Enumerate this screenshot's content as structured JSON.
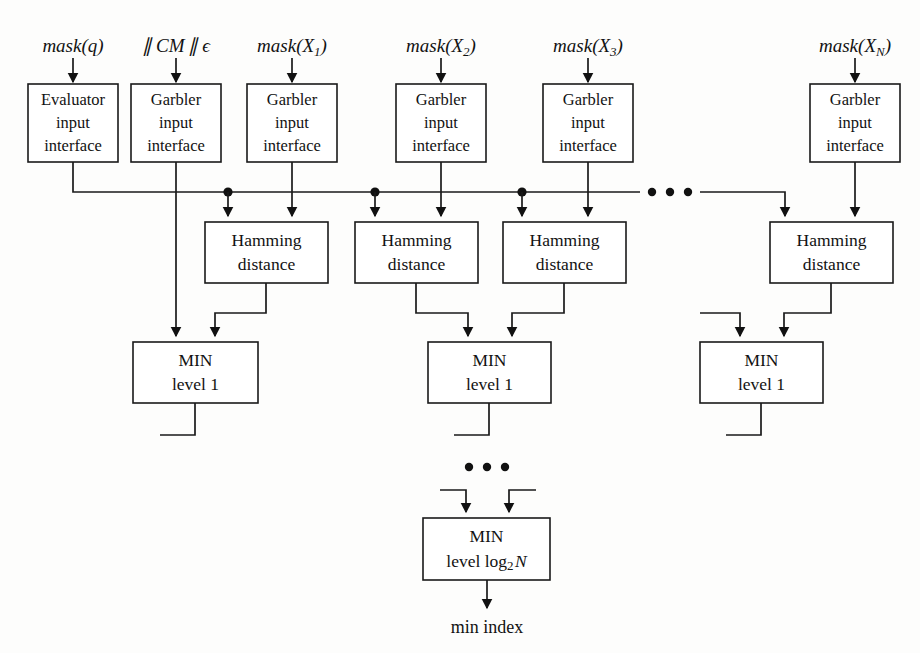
{
  "figure": {
    "type": "block-diagram",
    "title_visible": false,
    "ink_color": "#111111",
    "background_color": "#fdfdfc"
  },
  "top_inputs": [
    {
      "id": "in-q",
      "text": "mask(q)",
      "base": "mask",
      "arg": "q",
      "sub": "",
      "x": 73
    },
    {
      "id": "in-cm",
      "text": "|| CM || ϵ",
      "base": "CM",
      "arg": "",
      "sub": "",
      "x": 176
    },
    {
      "id": "in-x1",
      "text": "mask(X1)",
      "base": "mask",
      "arg": "X",
      "sub": "1",
      "x": 292
    },
    {
      "id": "in-x2",
      "text": "mask(X2)",
      "base": "mask",
      "arg": "X",
      "sub": "2",
      "x": 441
    },
    {
      "id": "in-x3",
      "text": "mask(X3)",
      "base": "mask",
      "arg": "X",
      "sub": "3",
      "x": 588
    },
    {
      "id": "in-xn",
      "text": "mask(XN)",
      "base": "mask",
      "arg": "X",
      "sub": "N",
      "x": 855
    }
  ],
  "interfaces": [
    {
      "id": "iface-evaluator",
      "line1": "Evaluator",
      "line2": "input",
      "line3": "interface",
      "x": 28,
      "y": 84,
      "w": 90,
      "h": 78
    },
    {
      "id": "iface-garbler-1",
      "line1": "Garbler",
      "line2": "input",
      "line3": "interface",
      "x": 131,
      "y": 84,
      "w": 90,
      "h": 78
    },
    {
      "id": "iface-garbler-2",
      "line1": "Garbler",
      "line2": "input",
      "line3": "interface",
      "x": 247,
      "y": 84,
      "w": 90,
      "h": 78
    },
    {
      "id": "iface-garbler-3",
      "line1": "Garbler",
      "line2": "input",
      "line3": "interface",
      "x": 396,
      "y": 84,
      "w": 90,
      "h": 78
    },
    {
      "id": "iface-garbler-4",
      "line1": "Garbler",
      "line2": "input",
      "line3": "interface",
      "x": 543,
      "y": 84,
      "w": 90,
      "h": 78
    },
    {
      "id": "iface-garbler-n",
      "line1": "Garbler",
      "line2": "input",
      "line3": "interface",
      "x": 810,
      "y": 84,
      "w": 90,
      "h": 78
    }
  ],
  "hamming_blocks": [
    {
      "id": "hamming-1",
      "line1": "Hamming",
      "line2": "distance",
      "x": 205,
      "y": 222,
      "w": 123,
      "h": 61
    },
    {
      "id": "hamming-2",
      "line1": "Hamming",
      "line2": "distance",
      "x": 355,
      "y": 222,
      "w": 123,
      "h": 61
    },
    {
      "id": "hamming-3",
      "line1": "Hamming",
      "line2": "distance",
      "x": 503,
      "y": 222,
      "w": 123,
      "h": 61
    },
    {
      "id": "hamming-n",
      "line1": "Hamming",
      "line2": "distance",
      "x": 770,
      "y": 222,
      "w": 123,
      "h": 61
    }
  ],
  "min_level1_blocks": [
    {
      "id": "min-l1-a",
      "line1": "MIN",
      "line2": "level 1",
      "x": 133,
      "y": 342,
      "w": 125,
      "h": 61
    },
    {
      "id": "min-l1-b",
      "line1": "MIN",
      "line2": "level 1",
      "x": 428,
      "y": 342,
      "w": 123,
      "h": 61
    },
    {
      "id": "min-l1-c",
      "line1": "MIN",
      "line2": "level 1",
      "x": 700,
      "y": 342,
      "w": 123,
      "h": 61
    }
  ],
  "min_final_block": {
    "id": "min-final",
    "line1": "MIN",
    "line2_prefix": "level log",
    "line2_sub": "2",
    "line2_suffix": "N",
    "x": 423,
    "y": 518,
    "w": 127,
    "h": 62
  },
  "output": {
    "id": "min-index-label",
    "text": "min index",
    "x": 487,
    "y": 628
  },
  "ellipses": [
    {
      "id": "ellipsis-bus",
      "cx": 670,
      "cy": 192,
      "label": "..."
    },
    {
      "id": "ellipsis-min-tree",
      "cx": 487,
      "cy": 467,
      "label": "..."
    }
  ],
  "bus": {
    "id": "evaluator-broadcast-bus",
    "y": 192,
    "x_start": 73,
    "x_gap_start": 640,
    "x_gap_end": 700,
    "x_end": 785,
    "tap_dots_x": [
      228,
      375,
      522
    ]
  },
  "ghost_text": {
    "lines": [
      "",
      "",
      "",
      "",
      "",
      "",
      "",
      "",
      "",
      "",
      "",
      "",
      "",
      "",
      "",
      "",
      "",
      "",
      "",
      "",
      "",
      "",
      ""
    ]
  }
}
